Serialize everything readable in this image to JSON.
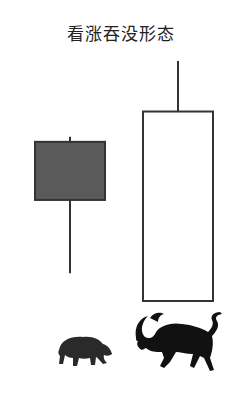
{
  "chart_data": {
    "type": "candlestick",
    "title": "看涨吞没形态",
    "xlabel": "",
    "ylabel": "",
    "grid": false,
    "legend": "none",
    "ylim": [
      0,
      100
    ],
    "candles": [
      {
        "name": "bearish-candle",
        "direction": "down",
        "open": 63,
        "close": 40,
        "high": 65,
        "low": 11,
        "fill": "#5a5a5a"
      },
      {
        "name": "bullish-candle",
        "direction": "up",
        "open": 0,
        "close": 75,
        "high": 95,
        "low": 0,
        "fill": "#ffffff"
      }
    ],
    "annotations": [
      {
        "label": "bear-icon",
        "under": "bearish-candle"
      },
      {
        "label": "bull-icon",
        "under": "bullish-candle"
      }
    ]
  },
  "colors": {
    "stroke": "#333333",
    "bear_fill": "#5a5a5a",
    "bull_fill": "#ffffff",
    "icon": "#111111"
  }
}
